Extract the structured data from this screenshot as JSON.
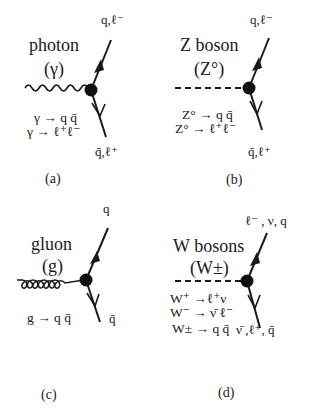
{
  "figure": {
    "panels": [
      {
        "id": "a",
        "caption": "(a)",
        "boson_name": "photon",
        "boson_symbol": "(γ)",
        "propagator_style": "wavy",
        "outgoing_top": "q,ℓ⁻",
        "outgoing_bottom": "q̄,ℓ⁺",
        "decays": [
          "γ → q q̄",
          "γ → ℓ⁺ℓ⁻"
        ]
      },
      {
        "id": "b",
        "caption": "(b)",
        "boson_name": "Z boson",
        "boson_symbol": "(Z°)",
        "propagator_style": "dashed",
        "outgoing_top": "q,ℓ⁻",
        "outgoing_bottom": "q̄,ℓ⁺",
        "decays": [
          "Z° → q q̄",
          "Z° → ℓ⁺ℓ⁻"
        ]
      },
      {
        "id": "c",
        "caption": "(c)",
        "boson_name": "gluon",
        "boson_symbol": "(g)",
        "propagator_style": "curly",
        "outgoing_top": "q",
        "outgoing_bottom": "q̄",
        "decays": [
          "g → q q̄"
        ]
      },
      {
        "id": "d",
        "caption": "(d)",
        "boson_name": "W bosons",
        "boson_symbol": "(W±)",
        "propagator_style": "dashed",
        "outgoing_top": "ℓ⁻ , ν, q",
        "outgoing_bottom": "ν̄ ,ℓ⁺, q̄",
        "decays": [
          "W⁺ →ℓ⁺ν",
          "W⁻ → ν̄  ℓ⁻",
          "W± → q q̄"
        ]
      }
    ],
    "colors": {
      "ink": "#1a1a1a",
      "background": "#ffffff"
    }
  }
}
